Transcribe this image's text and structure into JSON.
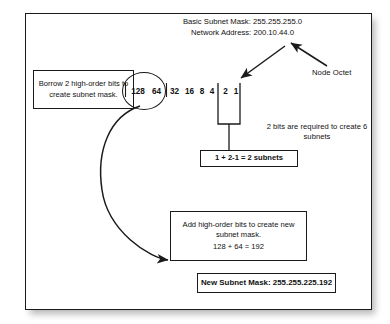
{
  "diagram": {
    "title_lines": {
      "basic_mask": "Basic Subnet Mask: 255.255.255.0",
      "network_address": "Network Address: 200.10.44.0"
    },
    "bit_weights": {
      "b128": "128",
      "b64": "64",
      "b32": "32",
      "b16": "16",
      "b8": "8",
      "b4": "4",
      "b2": "2",
      "b1": "1"
    },
    "callouts": {
      "borrow_box": "Borrow 2 high-order bits to create subnet mask.",
      "node_octet_label": "Node Octet",
      "bits_required": "2 bits are required to create 6 subnets",
      "subnets_equation": "1 + 2-1 = 2 subnets",
      "add_bits_title": "Add high-order bits to create new subnet mask.",
      "add_bits_equation": "128 + 64 = 192",
      "new_subnet_mask": "New Subnet Mask: 255.255.225.192"
    },
    "colors": {
      "ink": "#111111",
      "stroke": "#1a1a1a",
      "paper": "#ffffff",
      "shadow": "#a9a9a9"
    }
  }
}
